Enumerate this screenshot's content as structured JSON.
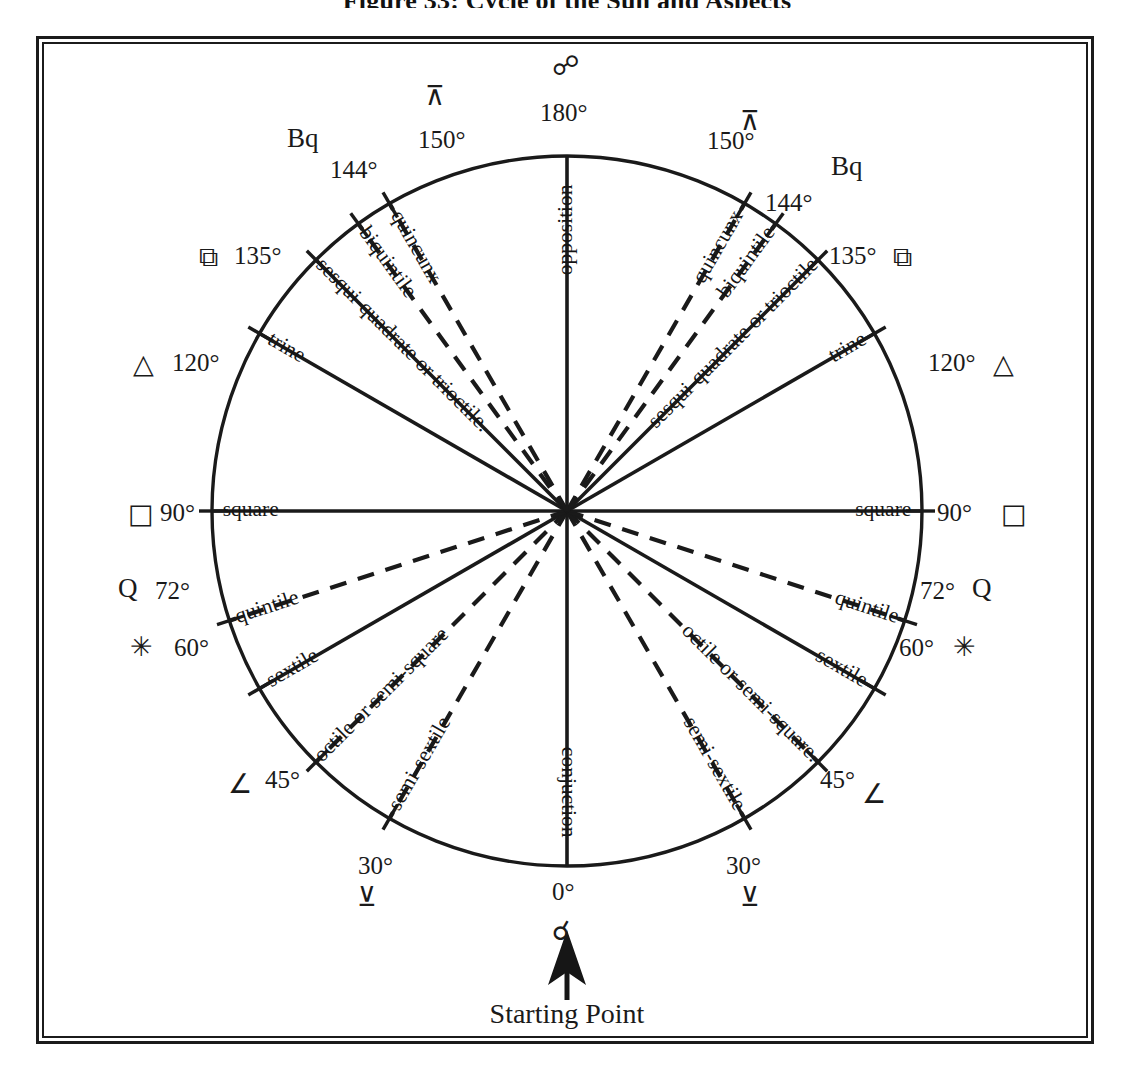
{
  "figure": {
    "title": "Figure 33:  Cycle of the Sun and Aspects",
    "starting_point_caption": "Starting Point",
    "starting_point_glyph": "☌",
    "starting_point_glyph_name": "conjunction-symbol"
  },
  "chart_data": {
    "type": "diagram",
    "title": "Cycle of the Sun and Aspects",
    "subtype": "aspect-wheel",
    "center": [
      567,
      511
    ],
    "radius": 355,
    "angle_zero_position": "bottom",
    "angle_direction_left": "counterclockwise-from-bottom",
    "angle_direction_right": "clockwise-from-bottom",
    "aspects": [
      {
        "degrees": 0,
        "degree_label": "0°",
        "name": "conjuction",
        "glyph": "☌",
        "glyph_name": "conjunction-symbol",
        "line_style": "solid",
        "sides": [
          "center"
        ]
      },
      {
        "degrees": 30,
        "degree_label": "30°",
        "name": "semi-sextile",
        "glyph": "⊻",
        "glyph_name": "semi-sextile-symbol",
        "line_style": "dashed",
        "sides": [
          "left",
          "right"
        ]
      },
      {
        "degrees": 45,
        "degree_label": "45°",
        "name": "octile or semi-square",
        "glyph": "∠",
        "glyph_name": "semi-square-symbol",
        "line_style": "dashed",
        "sides": [
          "left",
          "right"
        ]
      },
      {
        "degrees": 60,
        "degree_label": "60°",
        "name": "sextile",
        "glyph": "✳",
        "glyph_name": "sextile-symbol",
        "line_style": "solid",
        "sides": [
          "left",
          "right"
        ]
      },
      {
        "degrees": 72,
        "degree_label": "72°",
        "name": "quintile",
        "glyph": "Q",
        "glyph_name": "quintile-symbol",
        "line_style": "dashed",
        "sides": [
          "left",
          "right"
        ]
      },
      {
        "degrees": 90,
        "degree_label": "90°",
        "name": "square",
        "glyph": "□",
        "glyph_name": "square-symbol",
        "line_style": "solid",
        "sides": [
          "left",
          "right"
        ]
      },
      {
        "degrees": 120,
        "degree_label": "120°",
        "name": "trine",
        "glyph": "△",
        "glyph_name": "trine-symbol",
        "line_style": "solid",
        "sides": [
          "left",
          "right"
        ]
      },
      {
        "degrees": 135,
        "degree_label": "135°",
        "name": "sesqui-quadrate or trioctile",
        "glyph": "⧉",
        "glyph_name": "sesquiquadrate-symbol",
        "line_style": "solid",
        "sides": [
          "left",
          "right"
        ]
      },
      {
        "degrees": 144,
        "degree_label": "144°",
        "name": "biquintile",
        "glyph": "Bq",
        "glyph_name": "biquintile-symbol",
        "line_style": "dashed",
        "sides": [
          "left",
          "right"
        ]
      },
      {
        "degrees": 150,
        "degree_label": "150°",
        "name": "quincunx",
        "glyph": "⊼",
        "glyph_name": "quincunx-symbol",
        "line_style": "dashed",
        "sides": [
          "left",
          "right"
        ]
      },
      {
        "degrees": 180,
        "degree_label": "180°",
        "name": "opposition",
        "glyph": "☍",
        "glyph_name": "opposition-symbol",
        "line_style": "solid",
        "sides": [
          "center"
        ]
      }
    ],
    "spoke_labels_left": [
      "conjuction",
      "semi-sextile",
      "octile or semi-square",
      "sextile",
      "quintile",
      "square",
      "trine",
      "sesqui-quadrate or trioctile.",
      "biquintile",
      "quincunx",
      "opposition"
    ],
    "spoke_labels_right": [
      "semi-sextile",
      "octile or semi-square.",
      "sextile",
      "quintile",
      "square",
      "trine",
      "sesqui-quadrate or trioctile",
      "biquintile",
      "quincunx"
    ],
    "colors": {
      "ink": "#1a1a1a",
      "background": "#ffffff"
    }
  },
  "labels": {
    "left": [
      {
        "deg": "144°",
        "glyph": "Bq"
      },
      {
        "deg": "135°",
        "glyph": "⧉"
      },
      {
        "deg": "120°",
        "glyph": "△"
      },
      {
        "deg": "90°",
        "glyph": "□"
      },
      {
        "deg": "72°",
        "glyph": "Q"
      },
      {
        "deg": "60°",
        "glyph": "✳"
      },
      {
        "deg": "45°",
        "glyph": "∠"
      },
      {
        "deg": "30°",
        "glyph": "⊻"
      },
      {
        "deg": "150°",
        "glyph": "⊼"
      }
    ],
    "right": [
      {
        "deg": "144°",
        "glyph": "Bq"
      },
      {
        "deg": "135°",
        "glyph": "⧉"
      },
      {
        "deg": "120°",
        "glyph": "△"
      },
      {
        "deg": "90°",
        "glyph": "□"
      },
      {
        "deg": "72°",
        "glyph": "Q"
      },
      {
        "deg": "60°",
        "glyph": "✳"
      },
      {
        "deg": "45°",
        "glyph": "∠"
      },
      {
        "deg": "30°",
        "glyph": "⊻"
      },
      {
        "deg": "150°",
        "glyph": "⊼"
      }
    ],
    "top": {
      "deg": "180°",
      "glyph": "☍"
    },
    "bottom": {
      "deg": "0°",
      "glyph": "☌"
    }
  }
}
